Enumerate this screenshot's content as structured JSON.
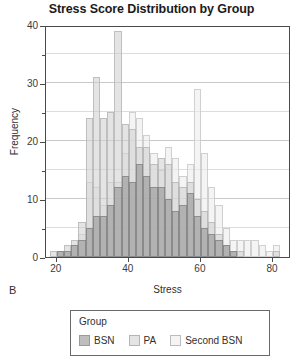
{
  "chart_data": {
    "type": "bar",
    "title": "Stress Score Distribution by Group",
    "subtitle": "",
    "xlabel": "Stress",
    "ylabel": "Frequency",
    "panel_label": "B",
    "xlim": [
      17,
      85
    ],
    "ylim": [
      0,
      40
    ],
    "xticks": [
      20,
      40,
      60,
      80
    ],
    "yticks": [
      0,
      10,
      20,
      30,
      40
    ],
    "yticks_minor": [
      5,
      15,
      25,
      35
    ],
    "grid": "horizontal",
    "overlap_mode": "overlay-translucent",
    "bin_width": 2,
    "legend": {
      "title": "Group",
      "position": "below-plot",
      "entries": [
        "BSN",
        "PA",
        "Second BSN"
      ]
    },
    "series": [
      {
        "name": "BSN",
        "color": "#969696",
        "bins": [
          19,
          21,
          23,
          25,
          27,
          29,
          31,
          33,
          35,
          37,
          39,
          41,
          43,
          45,
          47,
          49,
          51,
          53,
          55,
          57,
          59,
          61,
          63,
          65,
          67,
          69,
          71,
          73,
          75,
          77,
          79,
          81
        ],
        "values": [
          0,
          1,
          1,
          2,
          3,
          5,
          7,
          7,
          9,
          12,
          14,
          13,
          16,
          14,
          12,
          12,
          10,
          8,
          9,
          11,
          7,
          5,
          4,
          3,
          2,
          1,
          0,
          0,
          0,
          0,
          0,
          0
        ]
      },
      {
        "name": "PA",
        "color": "#cdcdcd",
        "bins": [
          19,
          21,
          23,
          25,
          27,
          29,
          31,
          33,
          35,
          37,
          39,
          41,
          43,
          45,
          47,
          49,
          51,
          53,
          55,
          57,
          59,
          61,
          63,
          65,
          67,
          69,
          71,
          73,
          75,
          77,
          79,
          81
        ],
        "values": [
          1,
          1,
          2,
          3,
          6,
          24,
          31,
          24,
          25,
          39,
          23,
          22,
          19,
          19,
          16,
          17,
          16,
          13,
          12,
          13,
          10,
          8,
          6,
          4,
          2,
          1,
          1,
          0,
          0,
          0,
          0,
          1
        ]
      },
      {
        "name": "Second BSN",
        "color": "#ececec",
        "bins": [
          19,
          21,
          23,
          25,
          27,
          29,
          31,
          33,
          35,
          37,
          39,
          41,
          43,
          45,
          47,
          49,
          51,
          53,
          55,
          57,
          59,
          61,
          63,
          65,
          67,
          69,
          71,
          73,
          75,
          77,
          79,
          81
        ],
        "values": [
          0,
          1,
          1,
          2,
          4,
          13,
          12,
          9,
          13,
          13,
          18,
          25,
          24,
          21,
          18,
          15,
          19,
          17,
          14,
          16,
          29,
          18,
          12,
          9,
          5,
          3,
          3,
          3,
          3,
          2,
          1,
          2
        ]
      }
    ]
  }
}
